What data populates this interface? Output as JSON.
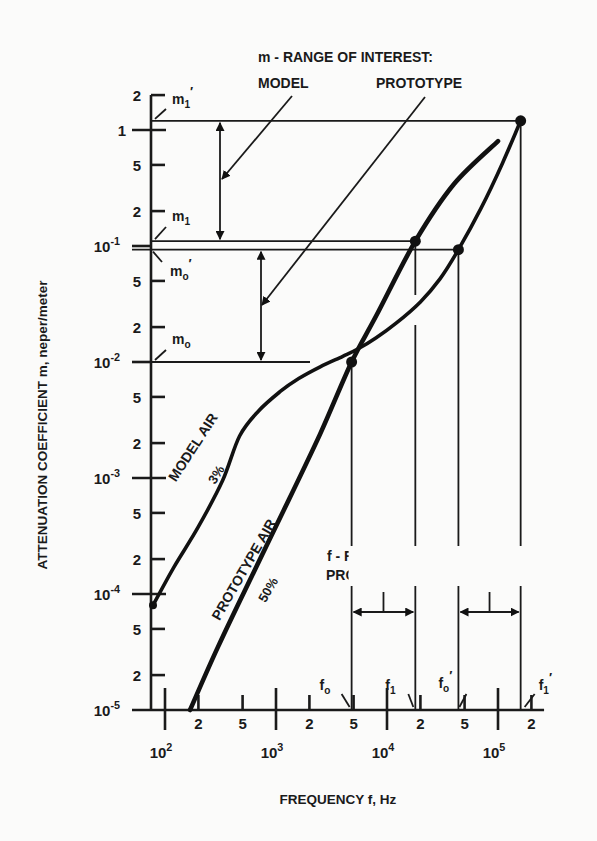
{
  "chart_data": {
    "type": "line",
    "title": "",
    "xlabel": "FREQUENCY f, Hz",
    "ylabel": "ATTENUATION COEFFICIENT m, neper/meter",
    "xscale": "log",
    "yscale": "log",
    "xlim": [
      70,
      300000
    ],
    "ylim": [
      1e-05,
      2
    ],
    "grid": false,
    "x_decade_ticks": [
      {
        "value": 100,
        "base": "10",
        "exp": "2"
      },
      {
        "value": 1000,
        "base": "10",
        "exp": "3"
      },
      {
        "value": 10000,
        "base": "10",
        "exp": "4"
      },
      {
        "value": 100000,
        "base": "10",
        "exp": "5"
      }
    ],
    "x_minor_ticks": [
      {
        "value": 200,
        "label": "2"
      },
      {
        "value": 500,
        "label": "5"
      },
      {
        "value": 2000,
        "label": "2"
      },
      {
        "value": 5000,
        "label": "5"
      },
      {
        "value": 20000,
        "label": "2"
      },
      {
        "value": 50000,
        "label": "5"
      },
      {
        "value": 200000,
        "label": "2"
      }
    ],
    "y_decade_ticks": [
      {
        "value": 1,
        "base": "1",
        "exp": ""
      },
      {
        "value": 0.1,
        "base": "10",
        "exp": "-1"
      },
      {
        "value": 0.01,
        "base": "10",
        "exp": "-2"
      },
      {
        "value": 0.001,
        "base": "10",
        "exp": "-3"
      },
      {
        "value": 0.0001,
        "base": "10",
        "exp": "-4"
      },
      {
        "value": 1e-05,
        "base": "10",
        "exp": "-5"
      }
    ],
    "y_minor_ticks": [
      {
        "value": 2,
        "label": "2"
      },
      {
        "value": 0.5,
        "label": "5"
      },
      {
        "value": 0.2,
        "label": "2"
      },
      {
        "value": 0.05,
        "label": "5"
      },
      {
        "value": 0.02,
        "label": "2"
      },
      {
        "value": 0.005,
        "label": "5"
      },
      {
        "value": 0.002,
        "label": "2"
      },
      {
        "value": 0.0005,
        "label": "5"
      },
      {
        "value": 0.0002,
        "label": "2"
      },
      {
        "value": 5e-05,
        "label": "5"
      },
      {
        "value": 2e-05,
        "label": "2"
      }
    ],
    "series": [
      {
        "name": "MODEL AIR 3%",
        "label_main": "MODEL AIR",
        "label_sub": "3%",
        "x": [
          78,
          120,
          200,
          330,
          470,
          700,
          1100,
          1600,
          2500,
          4000,
          5500,
          8000,
          12000,
          20000,
          30000,
          44000,
          70000,
          110000,
          160000
        ],
        "y": [
          8e-05,
          0.00017,
          0.00038,
          0.00095,
          0.0023,
          0.0038,
          0.0056,
          0.0072,
          0.0091,
          0.0112,
          0.013,
          0.0162,
          0.0215,
          0.033,
          0.052,
          0.093,
          0.21,
          0.52,
          1.2
        ]
      },
      {
        "name": "PROTOTYPE AIR 50%",
        "label_main": "PROTOTYPE AIR",
        "label_sub": "50%",
        "x": [
          168,
          300,
          600,
          1200,
          2500,
          4800,
          8000,
          18000,
          40000,
          100000
        ],
        "y": [
          1e-05,
          3.5e-05,
          0.00014,
          0.00055,
          0.0024,
          0.01,
          0.025,
          0.11,
          0.34,
          0.8
        ]
      }
    ],
    "marked_points": [
      {
        "name": "model-m1-prime",
        "x": 160000,
        "y": 1.2
      },
      {
        "name": "prototype-m1",
        "x": 18000,
        "y": 0.11
      },
      {
        "name": "model-m0-prime",
        "x": 44000,
        "y": 0.093
      },
      {
        "name": "prototype-m0",
        "x": 4800,
        "y": 0.01
      }
    ],
    "reference_levels": {
      "m1_prime": {
        "label": "m",
        "sub": "1",
        "prime": true,
        "value": 1.2
      },
      "m1": {
        "label": "m",
        "sub": "1",
        "prime": false,
        "value": 0.11
      },
      "m0_prime": {
        "label": "m",
        "sub": "o",
        "prime": true,
        "value": 0.093
      },
      "m0": {
        "label": "m",
        "sub": "o",
        "prime": false,
        "value": 0.01
      }
    },
    "reference_frequencies": {
      "f0": {
        "label": "f",
        "sub": "o",
        "prime": false,
        "value": 4800
      },
      "f1": {
        "label": "f",
        "sub": "1",
        "prime": false,
        "value": 18000
      },
      "f0_prime": {
        "label": "f",
        "sub": "o",
        "prime": true,
        "value": 44000
      },
      "f1_prime": {
        "label": "f",
        "sub": "1",
        "prime": true,
        "value": 160000
      }
    },
    "annotations": {
      "m_range_title": "m - RANGE OF INTEREST:",
      "m_range_model": "MODEL",
      "m_range_prototype": "PROTOTYPE",
      "f_range_title": "f - RANGE OF INTEREST:",
      "f_range_prototype": "PROTOTYPE",
      "f_range_model": "MODEL"
    }
  }
}
